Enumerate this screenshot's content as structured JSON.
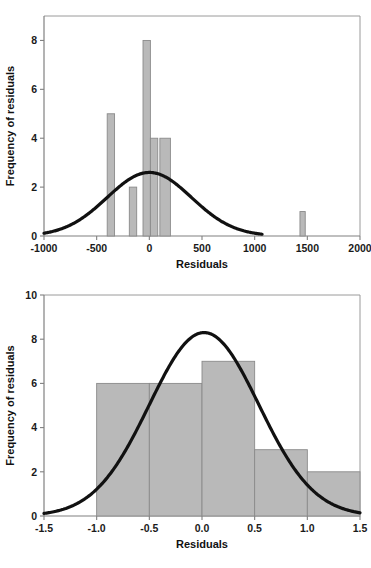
{
  "figure": {
    "background_color": "#ffffff",
    "bar_fill_color": "#b9b9b9",
    "bar_stroke_color": "#8a8a8a",
    "curve_color": "#111111",
    "axis_color": "#808080"
  },
  "chart_data": [
    {
      "id": "top-histogram",
      "type": "bar",
      "title": "",
      "xlabel": "Residuals",
      "ylabel": "Frequency of residuals",
      "xlim": [
        -1000,
        2000
      ],
      "ylim": [
        0,
        9
      ],
      "xticks": [
        -1000,
        -500,
        0,
        500,
        1000,
        1500,
        2000
      ],
      "xtick_labels": [
        "-1000",
        "-500",
        "0",
        "500",
        "1000",
        "1500",
        "2000"
      ],
      "yticks": [
        0,
        2,
        4,
        6,
        8
      ],
      "ytick_labels": [
        "0",
        "2",
        "4",
        "6",
        "8"
      ],
      "grid": false,
      "legend": "none",
      "bin_edges_note": "bars drawn as individual intervals on the residual axis",
      "bars": [
        {
          "x0": -400,
          "x1": -330,
          "value": 5
        },
        {
          "x0": -190,
          "x1": -120,
          "value": 2
        },
        {
          "x0": -60,
          "x1": 10,
          "value": 8
        },
        {
          "x0": 10,
          "x1": 80,
          "value": 4
        },
        {
          "x0": 100,
          "x1": 200,
          "value": 4
        },
        {
          "x0": 1430,
          "x1": 1480,
          "value": 1
        }
      ],
      "overlay_curve": {
        "name": "normal-distribution-curve",
        "kind": "normal",
        "mean": 0,
        "sigma": 400,
        "peak": 2.6,
        "x_start": -1000,
        "x_end": 1070
      }
    },
    {
      "id": "bottom-histogram",
      "type": "bar",
      "title": "",
      "xlabel": "Residuals",
      "ylabel": "Frequency of residuals",
      "xlim": [
        -1.5,
        1.5
      ],
      "ylim": [
        0,
        10
      ],
      "xticks": [
        -1.5,
        -1.0,
        -0.5,
        0.0,
        0.5,
        1.0,
        1.5
      ],
      "xtick_labels": [
        "-1.5",
        "-1.0",
        "-0.5",
        "0.0",
        "0.5",
        "1.0",
        "1.5"
      ],
      "yticks": [
        0,
        2,
        4,
        6,
        8,
        10
      ],
      "ytick_labels": [
        "0",
        "2",
        "4",
        "6",
        "8",
        "10"
      ],
      "grid": false,
      "legend": "none",
      "bin_edges_note": "contiguous bins of width 0.5",
      "bars": [
        {
          "x0": -1.0,
          "x1": -0.5,
          "value": 6
        },
        {
          "x0": -0.5,
          "x1": 0.0,
          "value": 6
        },
        {
          "x0": 0.0,
          "x1": 0.5,
          "value": 7
        },
        {
          "x0": 0.5,
          "x1": 1.0,
          "value": 3
        },
        {
          "x0": 1.0,
          "x1": 1.5,
          "value": 2
        }
      ],
      "overlay_curve": {
        "name": "normal-distribution-curve",
        "kind": "normal",
        "mean": 0.02,
        "sigma": 0.52,
        "peak": 8.3,
        "x_start": -1.5,
        "x_end": 1.5
      }
    }
  ]
}
